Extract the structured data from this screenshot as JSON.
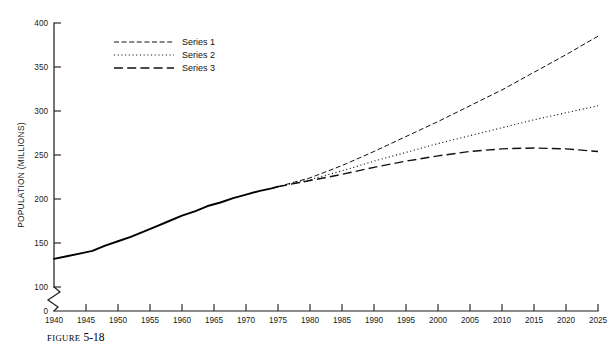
{
  "figure": {
    "caption_label": "FIGURE",
    "caption_number": "5-18"
  },
  "chart_data": {
    "type": "line",
    "title": "",
    "xlabel": "",
    "ylabel": "POPULATION (MILLIONS)",
    "xlim": [
      1940,
      2025
    ],
    "ylim": [
      100,
      400
    ],
    "y_axis_break": true,
    "y_break_label": "0",
    "grid": false,
    "legend_position": "top-left",
    "x_ticks": [
      1940,
      1945,
      1950,
      1955,
      1960,
      1965,
      1970,
      1975,
      1980,
      1985,
      1990,
      1995,
      2000,
      2005,
      2010,
      2015,
      2020,
      2025
    ],
    "x_tick_labels": [
      "1940",
      "1945",
      "1950",
      "1955",
      "1960",
      "1965",
      "1970",
      "1975",
      "1980",
      "1985",
      "1990",
      "1995",
      "2000",
      "2005",
      "2010",
      "2015",
      "2020",
      "2025"
    ],
    "y_ticks": [
      100,
      150,
      200,
      250,
      300,
      350,
      400
    ],
    "y_tick_labels": [
      "100",
      "150",
      "200",
      "250",
      "300",
      "350",
      "400"
    ],
    "historical": {
      "name": "Historical",
      "style": "solid",
      "x": [
        1940,
        1942,
        1944,
        1946,
        1948,
        1950,
        1952,
        1954,
        1956,
        1958,
        1960,
        1962,
        1964,
        1966,
        1968,
        1970,
        1972,
        1974,
        1975
      ],
      "values": [
        132,
        135,
        138,
        141,
        147,
        152,
        157,
        163,
        169,
        175,
        181,
        186,
        192,
        196,
        201,
        205,
        209,
        212,
        214
      ]
    },
    "series": [
      {
        "name": "Series 1",
        "style": "dashed",
        "x": [
          1975,
          1980,
          1985,
          1990,
          1995,
          2000,
          2005,
          2010,
          2015,
          2020,
          2025
        ],
        "values": [
          214,
          224,
          238,
          254,
          271,
          288,
          306,
          324,
          344,
          364,
          385
        ]
      },
      {
        "name": "Series 2",
        "style": "dotted",
        "x": [
          1975,
          1980,
          1985,
          1990,
          1995,
          2000,
          2005,
          2010,
          2015,
          2020,
          2025
        ],
        "values": [
          214,
          222,
          232,
          243,
          253,
          263,
          272,
          281,
          290,
          298,
          306
        ]
      },
      {
        "name": "Series 3",
        "style": "longdash",
        "x": [
          1975,
          1980,
          1985,
          1990,
          1995,
          2000,
          2005,
          2010,
          2015,
          2020,
          2025
        ],
        "values": [
          214,
          221,
          228,
          236,
          243,
          249,
          254,
          257,
          258,
          257,
          254
        ]
      }
    ]
  },
  "legend": {
    "items": [
      {
        "label": "Series 1",
        "style": "dashed"
      },
      {
        "label": "Series 2",
        "style": "dotted"
      },
      {
        "label": "Series 3",
        "style": "longdash"
      }
    ]
  },
  "colors": {
    "ink": "#111111",
    "axis": "#1a1a1a",
    "background": "#ffffff"
  }
}
